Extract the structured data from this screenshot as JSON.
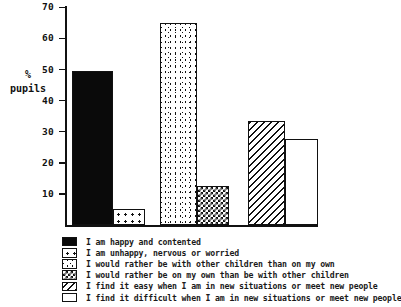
{
  "figure": {
    "cropped_header": "",
    "axis_title_line1": "%",
    "axis_title_line2": "pupils"
  },
  "chart_data": {
    "type": "bar",
    "title": "",
    "xlabel": "",
    "ylabel": "% pupils",
    "ylim": [
      0,
      72
    ],
    "grid": false,
    "legend_position": "bottom-left",
    "yticks": [
      10,
      20,
      30,
      40,
      50,
      60,
      70
    ],
    "ytick_labels": [
      "10",
      "20",
      "30",
      "40",
      "50",
      "60",
      "70"
    ],
    "categories": [
      "I am happy and contented",
      "I am unhappy, nervous or worried",
      "I would rather be with other children than on my own",
      "I would rather be on my own than be with other children",
      "I find it easy when I am in new situations or meet new people",
      "I find it difficult when I am in new situations or meet new people"
    ],
    "values": [
      49.5,
      5,
      65,
      12.5,
      33.5,
      27.5
    ],
    "patterns": [
      "solid-black",
      "coarse-dots",
      "speckle",
      "checker",
      "diagonal-hatch",
      "white"
    ],
    "bar_geometry": [
      {
        "left": 72,
        "width": 41
      },
      {
        "left": 113,
        "width": 32
      },
      {
        "left": 160,
        "width": 37
      },
      {
        "left": 197,
        "width": 32
      },
      {
        "left": 248,
        "width": 37
      },
      {
        "left": 285,
        "width": 33
      }
    ]
  },
  "legend": {
    "items": [
      {
        "pattern": "solid-black",
        "label": "I am happy and contented"
      },
      {
        "pattern": "coarse-dots",
        "label": "I am unhappy, nervous or worried"
      },
      {
        "pattern": "speckle",
        "label": "I would rather be with other children than on my own"
      },
      {
        "pattern": "checker",
        "label": "I would rather be on my own than be with other children"
      },
      {
        "pattern": "diagonal-hatch",
        "label": "I find it easy when I am in new situations or meet new people"
      },
      {
        "pattern": "white",
        "label": "I find it difficult when I am in new situations or meet new people"
      }
    ]
  },
  "colors": {
    "ink": "#111111",
    "paper": "#ffffff"
  }
}
